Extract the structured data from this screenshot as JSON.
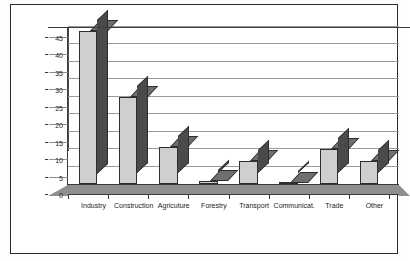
{
  "chart_data": {
    "type": "bar",
    "title": "",
    "subtitle": "",
    "xlabel": "",
    "ylabel": "",
    "categories": [
      "Industry",
      "Construction",
      "Agricuture",
      "Forestry",
      "Transport",
      "Communicat.",
      "Trade",
      "Other"
    ],
    "values": [
      44,
      25,
      10.5,
      1,
      6.5,
      0.3,
      10,
      6.5
    ],
    "series": [
      {
        "name": "Share",
        "values": [
          44,
          25,
          10.5,
          1,
          6.5,
          0.3,
          10,
          6.5
        ]
      }
    ],
    "ylim": [
      0,
      45
    ],
    "ytick_values": [
      0,
      5,
      10,
      15,
      20,
      25,
      30,
      35,
      40,
      45
    ],
    "ytick_labels": [
      "0",
      "5",
      "10",
      "15",
      "20",
      "25",
      "30",
      "35",
      "40",
      "45"
    ],
    "grid": true,
    "legend": false,
    "legend_position": "none",
    "style": "3d-column",
    "colors": {
      "bar_front": "#cfcfcf",
      "bar_side": "#4a4a4a",
      "bar_top": "#6e6e6e",
      "floor": "#8f8f8f",
      "gridline": "#9a9a9a",
      "axis": "#3a3a3a",
      "frame": "#2b2b2b",
      "text": "#1c1c1c",
      "background": "#ffffff"
    }
  }
}
